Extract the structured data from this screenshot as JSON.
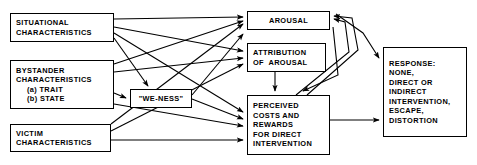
{
  "diagram": {
    "type": "flowchart",
    "nodes": [
      {
        "id": "situational",
        "name": "situational-characteristics",
        "lines": [
          "SITUATIONAL",
          "CHARACTERISTICS"
        ],
        "x": 10,
        "y": 13,
        "w": 104,
        "h": 29,
        "align": "left"
      },
      {
        "id": "bystander",
        "name": "bystander-characteristics",
        "lines": [
          "BYSTANDER",
          "CHARACTERISTICS",
          "(a) TRAIT",
          "(b) STATE"
        ],
        "indent": [
          false,
          false,
          true,
          true
        ],
        "x": 10,
        "y": 60,
        "w": 104,
        "h": 49,
        "align": "left"
      },
      {
        "id": "victim",
        "name": "victim-characteristics",
        "lines": [
          "VICTIM",
          "CHARACTERISTICS"
        ],
        "x": 10,
        "y": 124,
        "w": 101,
        "h": 28,
        "align": "left"
      },
      {
        "id": "weness",
        "name": "we-ness",
        "lines": [
          "\"WE-NESS\""
        ],
        "x": 130,
        "y": 89,
        "w": 62,
        "h": 19,
        "align": "center"
      },
      {
        "id": "arousal",
        "name": "arousal",
        "lines": [
          "AROUSAL"
        ],
        "x": 247,
        "y": 11,
        "w": 83,
        "h": 19,
        "align": "center"
      },
      {
        "id": "attribution",
        "name": "attribution-of-arousal",
        "lines": [
          "ATTRIBUTION",
          "OF  AROUSAL"
        ],
        "x": 247,
        "y": 43,
        "w": 79,
        "h": 29,
        "align": "left"
      },
      {
        "id": "costs",
        "name": "perceived-costs-and-rewards",
        "lines": [
          "PERCEIVED",
          "COSTS AND",
          "REWARDS",
          "FOR DIRECT",
          "INTERVENTION"
        ],
        "x": 247,
        "y": 95,
        "w": 83,
        "h": 60,
        "align": "left"
      },
      {
        "id": "response",
        "name": "response",
        "lines": [
          "RESPONSE:",
          "NONE,",
          "DIRECT OR",
          "INDIRECT",
          "INTERVENTION,",
          "ESCAPE,",
          "DISTORTION"
        ],
        "x": 383,
        "y": 47,
        "w": 84,
        "h": 90,
        "align": "left"
      }
    ],
    "edges": [
      {
        "name": "edge-situational-to-arousal",
        "from": "situational",
        "to": "arousal",
        "path": "M114,19 L243,17"
      },
      {
        "name": "edge-situational-to-attribution",
        "from": "situational",
        "to": "attribution",
        "path": "M114,27 L243,51"
      },
      {
        "name": "edge-situational-to-costs",
        "from": "situational",
        "to": "costs",
        "path": "M114,33 L243,112"
      },
      {
        "name": "edge-situational-to-weness",
        "from": "situational",
        "to": "weness",
        "path": "M114,38 L148,86"
      },
      {
        "name": "edge-bystander-to-arousal",
        "from": "bystander",
        "to": "arousal",
        "path": "M114,64 L243,21"
      },
      {
        "name": "edge-bystander-to-attribution",
        "from": "bystander",
        "to": "attribution",
        "path": "M114,72 L243,58"
      },
      {
        "name": "edge-bystander-to-weness",
        "from": "bystander",
        "to": "weness",
        "path": "M114,93 L126,98"
      },
      {
        "name": "edge-bystander-to-costs",
        "from": "bystander",
        "to": "costs",
        "path": "M114,104 L243,126"
      },
      {
        "name": "edge-victim-to-arousal",
        "from": "victim",
        "to": "arousal",
        "path": "M111,124 L243,24"
      },
      {
        "name": "edge-victim-to-attribution",
        "from": "victim",
        "to": "attribution",
        "path": "M111,131 L243,64"
      },
      {
        "name": "edge-victim-to-costs",
        "from": "victim",
        "to": "costs",
        "path": "M111,140 L243,140"
      },
      {
        "name": "edge-weness-to-costs",
        "from": "weness",
        "to": "costs",
        "path": "M192,99 L243,119"
      },
      {
        "name": "edge-weness-to-arousal",
        "from": "weness",
        "to": "arousal",
        "path": "M192,95 L243,34"
      },
      {
        "name": "edge-attribution-to-costs",
        "from": "attribution",
        "to": "costs",
        "path": "M275,72 L275,91"
      },
      {
        "name": "edge-arousal-to-costs",
        "from": "arousal",
        "to": "costs",
        "path": "M333,27 L338,75 L303,91"
      },
      {
        "name": "edge-costs-to-arousal-a",
        "from": "costs",
        "to": "arousal",
        "path": "M296,95 L349,52 L345,22 L334,19"
      },
      {
        "name": "edge-costs-to-arousal-b",
        "from": "costs",
        "to": "arousal",
        "path": "M307,95 L358,50 L352,18 L334,16"
      },
      {
        "name": "edge-arousal-to-response",
        "from": "arousal",
        "to": "response",
        "path": "M336,14 L363,33 L379,58"
      },
      {
        "name": "edge-costs-to-response",
        "from": "costs",
        "to": "response",
        "path": "M330,120 L379,120"
      }
    ]
  }
}
